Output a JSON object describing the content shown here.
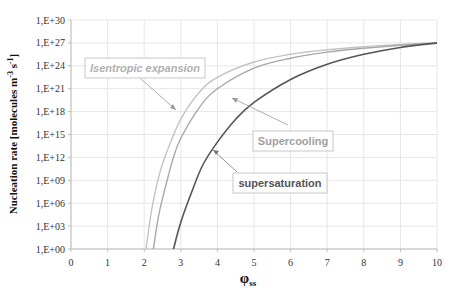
{
  "chart_data": {
    "type": "line",
    "title": "",
    "xlabel": "φss",
    "ylabel": "Nucleation rate [molecules m-3 s-1]",
    "y_scale": "log10",
    "xlim": [
      0,
      10
    ],
    "ylim_exponent": [
      0,
      30
    ],
    "x_ticks": [
      "0",
      "1",
      "2",
      "3",
      "4",
      "5",
      "6",
      "7",
      "8",
      "9",
      "10"
    ],
    "y_ticks": [
      "1,E+00",
      "1,E+03",
      "1,E+06",
      "1,E+09",
      "1,E+12",
      "1,E+15",
      "1,E+18",
      "1,E+21",
      "1,E+24",
      "1,E+27",
      "1,E+30"
    ],
    "grid": true,
    "legend": "none (inline annotations)",
    "series": [
      {
        "name": "Isentropic expansion",
        "color": "#c4c4c4",
        "x": [
          2.05,
          2.2,
          2.4,
          2.6,
          3.0,
          3.5,
          4.0,
          5.0,
          6.0,
          7.0,
          8.0,
          9.0,
          10.0
        ],
        "log10_y": [
          0,
          5,
          9.5,
          12.5,
          17.0,
          20.5,
          22.5,
          24.5,
          25.5,
          26.1,
          26.5,
          26.8,
          27.0
        ]
      },
      {
        "name": "Supercooling",
        "color": "#a8a8a8",
        "x": [
          2.25,
          2.4,
          2.6,
          2.8,
          3.0,
          3.5,
          4.0,
          5.0,
          6.0,
          7.0,
          8.0,
          9.0,
          10.0
        ],
        "log10_y": [
          0,
          4.5,
          8.5,
          12.0,
          14.5,
          18.5,
          21.0,
          23.7,
          25.0,
          25.8,
          26.3,
          26.7,
          27.0
        ]
      },
      {
        "name": "supersaturation",
        "color": "#555555",
        "x": [
          2.8,
          3.0,
          3.3,
          3.6,
          4.0,
          4.5,
          5.0,
          6.0,
          7.0,
          8.0,
          9.0,
          10.0
        ],
        "log10_y": [
          0,
          3.5,
          7.5,
          11.0,
          14.0,
          17.0,
          19.2,
          22.2,
          24.2,
          25.5,
          26.4,
          27.0
        ]
      }
    ],
    "annotations": [
      {
        "text": "Isentropic expansion",
        "style": "italic bold",
        "color": "#b0b0b0"
      },
      {
        "text": "Supercooling",
        "style": "bold",
        "color": "#a0a0a0"
      },
      {
        "text": "supersaturation",
        "style": "bold",
        "color": "#555555"
      }
    ]
  },
  "axes": {
    "ylabel_main": "Nucleation rate [molecules m",
    "ylabel_sup1": "-3",
    "ylabel_mid": " s",
    "ylabel_sup2": "-1",
    "ylabel_end": "]",
    "xlabel_main": "φ",
    "xlabel_sub": "ss"
  }
}
